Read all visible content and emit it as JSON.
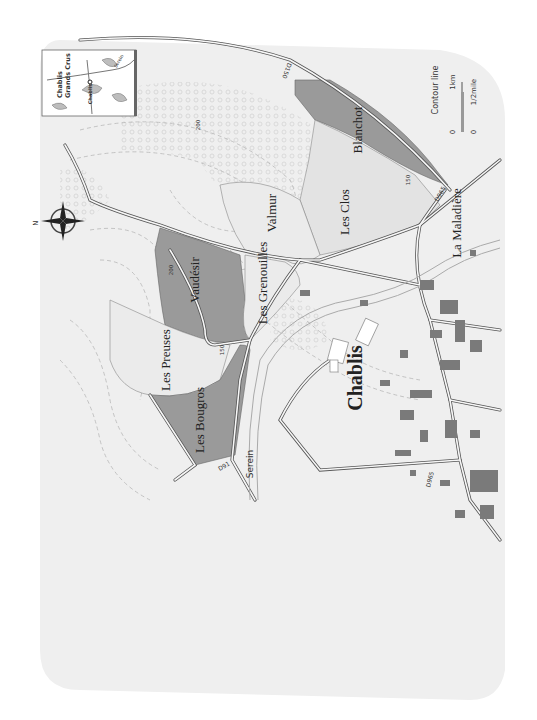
{
  "map": {
    "title": "Chablis Grands Crus",
    "orientation": "rotated 90° (north points left)",
    "compass": {
      "label": "N"
    },
    "inset": {
      "title_line1": "Chablis",
      "title_line2": "Grands Crus",
      "town": "Chablis",
      "river": "Serein"
    },
    "vineyards": [
      {
        "name": "Blanchot",
        "fill": "#9a9a9a"
      },
      {
        "name": "Les Clos",
        "fill": "#e4e4e4"
      },
      {
        "name": "Valmur",
        "fill": "#ececec"
      },
      {
        "name": "Vaudésir",
        "fill": "#9a9a9a"
      },
      {
        "name": "Les Grenouilles",
        "fill": "#ececec"
      },
      {
        "name": "Les Preuses",
        "fill": "#ececec"
      },
      {
        "name": "Les Bougros",
        "fill": "#9a9a9a"
      }
    ],
    "places": {
      "town": "Chablis",
      "hamlet": "La Maladière",
      "river": "Serein"
    },
    "roads": {
      "d150": "D150",
      "d965_north": "D965",
      "d965_south": "D965",
      "d91": "D91"
    },
    "contours": {
      "c200_a": "200",
      "c200_b": "200",
      "c150_a": "150",
      "c150_b": "150"
    },
    "legend": {
      "contour_label": "Contour line",
      "scale_km_0": "0",
      "scale_km_1": "1km",
      "scale_mi_0": "0",
      "scale_mi_1": "1/2mile"
    },
    "colors": {
      "grand_cru": "#9a9a9a",
      "other_vineyard": "#e6e6e6",
      "background": "#f1f1f1",
      "buildings": "#7a7a7a",
      "road_outline": "#555555"
    }
  }
}
